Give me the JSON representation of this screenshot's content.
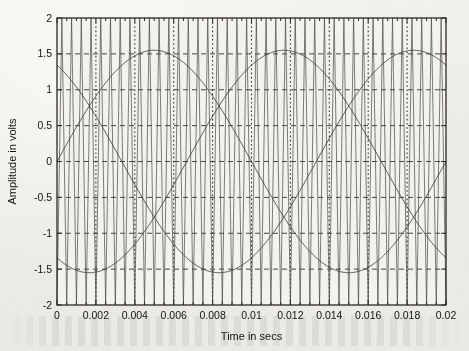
{
  "chart_data": {
    "type": "line",
    "title": "",
    "xlabel": "Time in secs",
    "ylabel": "Amplitude in volts",
    "xlim": [
      0,
      0.02
    ],
    "ylim": [
      -2,
      2
    ],
    "grid": true,
    "legend": "none",
    "x_ticks": [
      "0",
      "0.002",
      "0.004",
      "0.006",
      "0.008",
      "0.01",
      "0.012",
      "0.014",
      "0.016",
      "0.018",
      "0.02"
    ],
    "x_tick_values": [
      0,
      0.002,
      0.004,
      0.006,
      0.008,
      0.01,
      0.012,
      0.014,
      0.016,
      0.018,
      0.02
    ],
    "x_minor_tick_step": 0.0005,
    "y_ticks": [
      "2",
      "1.5",
      "1",
      "0.5",
      "0",
      "-0.5",
      "-1",
      "-1.5",
      "-2"
    ],
    "y_tick_values": [
      2,
      1.5,
      1,
      0.5,
      0,
      -0.5,
      -1,
      -1.5,
      -2
    ],
    "series": [
      {
        "name": "triangular-carrier",
        "kind": "triangle",
        "amplitude": 2.0,
        "frequency": 2000,
        "phase_deg": 0,
        "color": "#4a4843",
        "width": 0.7
      },
      {
        "name": "reference-phase-a",
        "kind": "sine",
        "amplitude": 1.55,
        "frequency": 50,
        "phase_deg": 0,
        "color": "#3a3834",
        "width": 0.9
      },
      {
        "name": "reference-phase-b",
        "kind": "sine",
        "amplitude": 1.55,
        "frequency": 50,
        "phase_deg": 120,
        "color": "#3a3834",
        "width": 0.9
      },
      {
        "name": "reference-phase-c",
        "kind": "sine",
        "amplitude": 1.55,
        "frequency": 50,
        "phase_deg": 240,
        "color": "#3a3834",
        "width": 0.9
      }
    ],
    "colors": {
      "axis": "#2b2926",
      "grid_horizontal": "#33312d",
      "grid_vertical": "#33312d",
      "background": "#f5f4f0"
    }
  },
  "plot_box": {
    "left": 57,
    "top": 18,
    "right": 446,
    "bottom": 305
  }
}
